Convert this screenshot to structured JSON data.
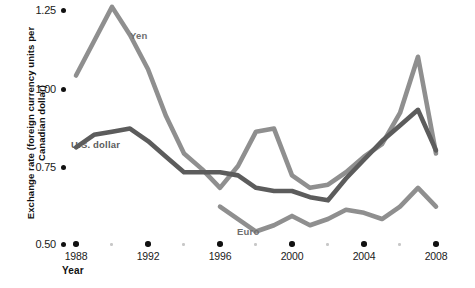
{
  "chart_data": {
    "type": "line",
    "title": "",
    "xlabel": "Year",
    "ylabel": "Exchange rate (foreign currency units per Canadian dollar)",
    "xlim": [
      1988,
      2008
    ],
    "ylim": [
      0.5,
      1.25
    ],
    "grid": false,
    "legend_position": "inline-labels",
    "x_ticks": [
      1988,
      1992,
      1996,
      2000,
      2004,
      2008
    ],
    "x_tick_labels": [
      "1988",
      "1992",
      "1996",
      "2000",
      "2004",
      "2008"
    ],
    "x_minor_ticks": [
      1990,
      1994,
      1998,
      2002,
      2006
    ],
    "y_ticks": [
      0.5,
      0.75,
      1.0,
      1.25
    ],
    "y_tick_labels": [
      "0.50",
      "0.75",
      "1.00",
      "1.25"
    ],
    "series": [
      {
        "name": "Yen",
        "color": "#8f8f8f",
        "label_x": 2008,
        "x": [
          1988,
          1989,
          1990,
          1991,
          1992,
          1993,
          1994,
          1995,
          1996,
          1997,
          1998,
          1999,
          2000,
          2001,
          2002,
          2003,
          2004,
          2005,
          2006,
          2007,
          2008
        ],
        "values": [
          1.04,
          1.15,
          1.26,
          1.17,
          1.06,
          0.91,
          0.79,
          0.74,
          0.68,
          0.75,
          0.86,
          0.87,
          0.72,
          0.68,
          0.69,
          0.73,
          0.78,
          0.82,
          0.92,
          1.1,
          0.79
        ]
      },
      {
        "name": "U.S. dollar",
        "color": "#5c5c5c",
        "x": [
          1988,
          1989,
          1990,
          1991,
          1992,
          1993,
          1994,
          1995,
          1996,
          1997,
          1998,
          1999,
          2000,
          2001,
          2002,
          2003,
          2004,
          2005,
          2006,
          2007,
          2008
        ],
        "values": [
          0.81,
          0.85,
          0.86,
          0.87,
          0.83,
          0.78,
          0.73,
          0.73,
          0.73,
          0.72,
          0.68,
          0.67,
          0.67,
          0.65,
          0.64,
          0.71,
          0.77,
          0.83,
          0.88,
          0.93,
          0.8
        ]
      },
      {
        "name": "Euro",
        "color": "#8f8f8f",
        "x": [
          1996,
          1997,
          1998,
          1999,
          2000,
          2001,
          2002,
          2003,
          2004,
          2005,
          2006,
          2007,
          2008
        ],
        "values": [
          0.62,
          0.58,
          0.54,
          0.56,
          0.59,
          0.56,
          0.58,
          0.61,
          0.6,
          0.58,
          0.62,
          0.68,
          0.62
        ]
      }
    ]
  },
  "axes": {
    "y_title": "Exchange rate (foreign currency units per Canadian dollar)",
    "x_title": "Year",
    "y_tick_labels": [
      "1.25",
      "1.00",
      "0.75",
      "0.50"
    ],
    "x_tick_labels": [
      "1988",
      "1992",
      "1996",
      "2000",
      "2004",
      "2008"
    ]
  },
  "series_labels": {
    "yen": "Yen",
    "usd": "U.S. dollar",
    "euro": "Euro"
  },
  "caption": {
    "text": ""
  }
}
